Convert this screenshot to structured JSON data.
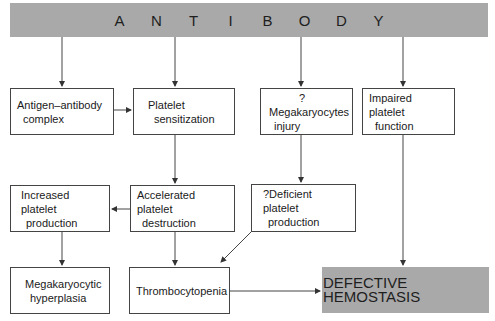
{
  "banner": {
    "letters": [
      "A",
      "N",
      "T",
      "I",
      "B",
      "O",
      "D",
      "Y"
    ],
    "color": "#a9a9a9"
  },
  "nodes": {
    "antigen_antibody": {
      "lines": [
        "Antigen–antibody",
        "complex"
      ]
    },
    "platelet_sensitization": {
      "lines": [
        "Platelet",
        "sensitization"
      ]
    },
    "megakaryocytes_injury": {
      "lines": [
        "?",
        "Megakaryocytes",
        "injury"
      ]
    },
    "impaired_function": {
      "lines": [
        "Impaired platelet",
        "function"
      ]
    },
    "increased_production": {
      "lines": [
        "Increased platelet",
        "production"
      ]
    },
    "accelerated_destruction": {
      "lines": [
        "Accelerated platelet",
        "destruction"
      ]
    },
    "deficient_production": {
      "lines": [
        "?Deficient platelet",
        "production"
      ]
    },
    "megakaryocytic_hyperplasia": {
      "lines": [
        "Megakaryocytic",
        "hyperplasia"
      ]
    },
    "thrombocytopenia": {
      "lines": [
        "Thrombocytopenia"
      ]
    },
    "defective_hemostasis": {
      "lines": [
        "DEFECTIVE HEMOSTASIS"
      ],
      "color": "#a9a9a9"
    }
  },
  "edges": [
    [
      "antibody",
      "antigen_antibody"
    ],
    [
      "antibody",
      "platelet_sensitization"
    ],
    [
      "antibody",
      "megakaryocytes_injury"
    ],
    [
      "antibody",
      "impaired_function"
    ],
    [
      "antigen_antibody",
      "platelet_sensitization"
    ],
    [
      "platelet_sensitization",
      "accelerated_destruction"
    ],
    [
      "megakaryocytes_injury",
      "deficient_production"
    ],
    [
      "accelerated_destruction",
      "increased_production"
    ],
    [
      "increased_production",
      "megakaryocytic_hyperplasia"
    ],
    [
      "accelerated_destruction",
      "thrombocytopenia"
    ],
    [
      "deficient_production",
      "thrombocytopenia"
    ],
    [
      "thrombocytopenia",
      "defective_hemostasis"
    ],
    [
      "impaired_function",
      "defective_hemostasis"
    ]
  ]
}
